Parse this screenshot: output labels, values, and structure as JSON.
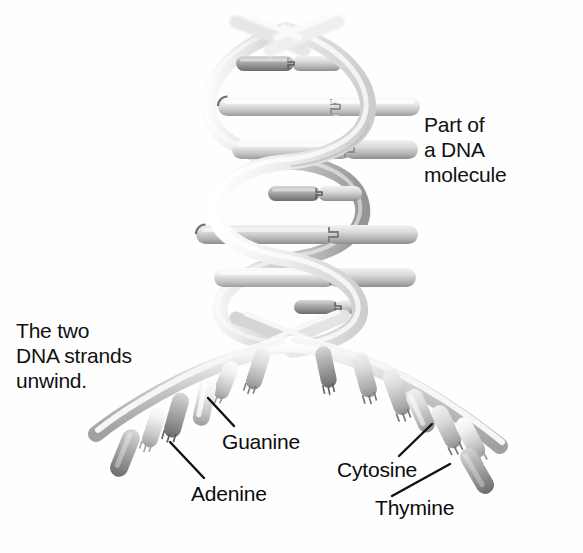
{
  "figure": {
    "background_color": "#fefefe",
    "ink_color": "#111111"
  },
  "captions": {
    "part_of_molecule": "Part of\na DNA\nmolecule",
    "strands_unwind": "The two\nDNA strands\nunwind."
  },
  "base_labels": [
    {
      "name": "Guanine",
      "text": "Guanine"
    },
    {
      "name": "Cytosine",
      "text": "Cytosine"
    },
    {
      "name": "Adenine",
      "text": "Adenine"
    },
    {
      "name": "Thymine",
      "text": "Thymine"
    }
  ],
  "palette": {
    "ribbon_light": "#e3e3e3",
    "ribbon_mid": "#c9c9c9",
    "ribbon_dark": "#9a9a9a",
    "rod_light": "#ededed",
    "rod_mid": "#bdbdbd",
    "rod_dark": "#8a8a8a",
    "rod_darkest": "#6e6e6e",
    "leader_line": "#111111"
  },
  "structure": {
    "helix_turns": 3,
    "base_pair_rungs": 6,
    "unwound_bases_left": 6,
    "unwound_bases_right": 7,
    "fork_point": {
      "x": 286,
      "y": 330
    }
  }
}
